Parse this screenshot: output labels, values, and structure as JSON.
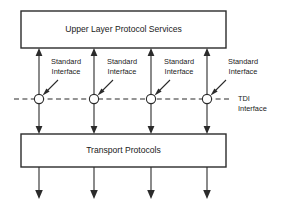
{
  "diagram": {
    "title_top_box": "Upper Layer Protocol Services",
    "title_bottom_box": "Transport Protocols",
    "interface_labels": [
      {
        "line1": "Standard",
        "line2": "Interface"
      },
      {
        "line1": "Standard",
        "line2": "Interface"
      },
      {
        "line1": "Standard",
        "line2": "Interface"
      },
      {
        "line1": "Standard",
        "line2": "Interface"
      }
    ],
    "boundary_label": {
      "line1": "TDI",
      "line2": "Interface"
    },
    "colors": {
      "stroke": "#2b2b2b",
      "fill": "#ffffff",
      "text": "#1a1a1a"
    },
    "geometry": {
      "top_box": {
        "x": 21,
        "y": 11,
        "w": 205,
        "h": 37
      },
      "bottom_box": {
        "x": 21,
        "y": 134,
        "w": 205,
        "h": 33
      },
      "channel_x": [
        39,
        94,
        151,
        207
      ],
      "tdi_line_y": 99,
      "tdi_line_x_start": 14,
      "tdi_line_x_end": 230,
      "node_radius": 4.6
    }
  }
}
